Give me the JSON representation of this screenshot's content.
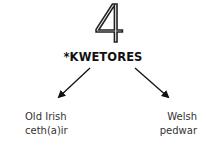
{
  "numeral": "4",
  "root_word": "*KWETORES",
  "branches": [
    {
      "language": "Old Irish",
      "word": "ceth(a)ir"
    },
    {
      "language": "Welsh",
      "word": "pedwar"
    }
  ]
}
